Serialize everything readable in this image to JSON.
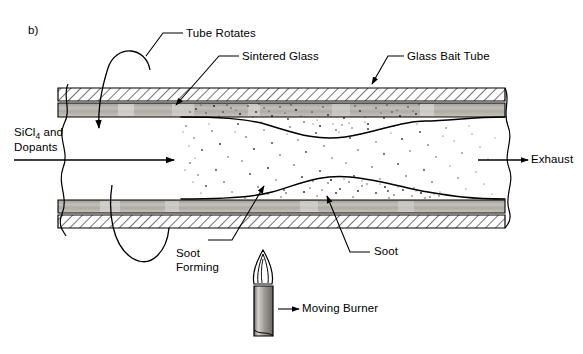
{
  "figure": {
    "panel_label": "b)",
    "process": "Modified Chemical Vapor Deposition",
    "labels": {
      "tube_rotates": "Tube Rotates",
      "sintered_glass": "Sintered Glass",
      "glass_bait_tube": "Glass Bait Tube",
      "exhaust": "Exhaust",
      "soot_forming_line1": "Soot",
      "soot_forming_line2": "Forming",
      "soot": "Soot",
      "moving_burner": "Moving Burner",
      "inlet_line1": "SiCl",
      "inlet_sub": "4",
      "inlet_line1_tail": " and",
      "inlet_line2": "Dopants"
    },
    "colors": {
      "ink": "#000000",
      "sintered_glass_fill": "#b9b6b0",
      "soot_fill": "#ffffff",
      "hatch": "#000000",
      "burner_body": "#a8a49e",
      "background": "#ffffff"
    }
  }
}
